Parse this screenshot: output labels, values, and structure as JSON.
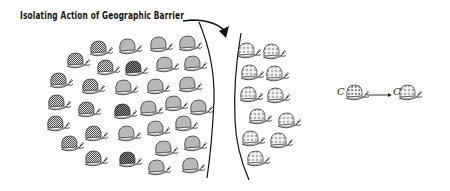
{
  "title": "Isolating Action of Geographic Barrier",
  "transition": {
    "from_label": "C",
    "to_label": "C′",
    "arrow_icon": "right-arrow"
  },
  "colors": {
    "gray_shell": "#b8b8b8",
    "checked_shell": "#9a9a9a",
    "dark_shell": "#5e5e5e",
    "outline": "#222222",
    "barrier": "#111111"
  },
  "populations": {
    "original": {
      "snails": [
        {
          "x": 98,
          "y": 48,
          "type": "checked"
        },
        {
          "x": 127,
          "y": 46,
          "type": "gray"
        },
        {
          "x": 158,
          "y": 44,
          "type": "gray"
        },
        {
          "x": 187,
          "y": 43,
          "type": "gray"
        },
        {
          "x": 75,
          "y": 60,
          "type": "checked"
        },
        {
          "x": 105,
          "y": 67,
          "type": "checked"
        },
        {
          "x": 133,
          "y": 68,
          "type": "dark"
        },
        {
          "x": 164,
          "y": 64,
          "type": "gray"
        },
        {
          "x": 192,
          "y": 63,
          "type": "gray"
        },
        {
          "x": 58,
          "y": 80,
          "type": "checked"
        },
        {
          "x": 90,
          "y": 86,
          "type": "checked"
        },
        {
          "x": 123,
          "y": 87,
          "type": "gray"
        },
        {
          "x": 155,
          "y": 86,
          "type": "gray"
        },
        {
          "x": 187,
          "y": 84,
          "type": "gray"
        },
        {
          "x": 56,
          "y": 102,
          "type": "checked"
        },
        {
          "x": 86,
          "y": 109,
          "type": "checked"
        },
        {
          "x": 122,
          "y": 111,
          "type": "dark"
        },
        {
          "x": 148,
          "y": 108,
          "type": "gray"
        },
        {
          "x": 173,
          "y": 103,
          "type": "gray"
        },
        {
          "x": 198,
          "y": 107,
          "type": "gray"
        },
        {
          "x": 55,
          "y": 123,
          "type": "checked"
        },
        {
          "x": 93,
          "y": 133,
          "type": "checked"
        },
        {
          "x": 126,
          "y": 133,
          "type": "gray"
        },
        {
          "x": 155,
          "y": 128,
          "type": "gray"
        },
        {
          "x": 183,
          "y": 123,
          "type": "gray"
        },
        {
          "x": 69,
          "y": 143,
          "type": "checked"
        },
        {
          "x": 163,
          "y": 148,
          "type": "gray"
        },
        {
          "x": 192,
          "y": 143,
          "type": "gray"
        },
        {
          "x": 93,
          "y": 158,
          "type": "checked"
        },
        {
          "x": 127,
          "y": 159,
          "type": "dark"
        },
        {
          "x": 156,
          "y": 167,
          "type": "gray"
        },
        {
          "x": 190,
          "y": 165,
          "type": "gray"
        }
      ]
    },
    "isolated": {
      "snails": [
        {
          "x": 246,
          "y": 50,
          "type": "dotted"
        },
        {
          "x": 271,
          "y": 51,
          "type": "dotted"
        },
        {
          "x": 249,
          "y": 72,
          "type": "dotted"
        },
        {
          "x": 274,
          "y": 73,
          "type": "dotted"
        },
        {
          "x": 248,
          "y": 94,
          "type": "dotted"
        },
        {
          "x": 275,
          "y": 95,
          "type": "dotted"
        },
        {
          "x": 257,
          "y": 116,
          "type": "dotted"
        },
        {
          "x": 286,
          "y": 120,
          "type": "dotted"
        },
        {
          "x": 250,
          "y": 138,
          "type": "dotted"
        },
        {
          "x": 278,
          "y": 140,
          "type": "dotted"
        },
        {
          "x": 255,
          "y": 158,
          "type": "dotted"
        }
      ]
    }
  },
  "legend_snails": [
    {
      "x": 354,
      "y": 92,
      "type": "dotted-dense"
    },
    {
      "x": 407,
      "y": 92,
      "type": "dotted"
    }
  ]
}
